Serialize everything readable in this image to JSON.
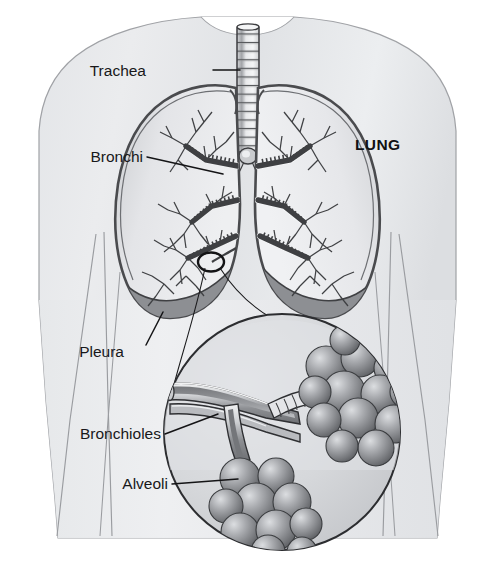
{
  "figure": {
    "width": 495,
    "height": 568,
    "background_color": "#ffffff"
  },
  "labels": {
    "trachea": "Trachea",
    "bronchi": "Bronchi",
    "lung": "LUNG",
    "pleura": "Pleura",
    "bronchioles": "Bronchioles",
    "alveoli": "Alveoli"
  },
  "colors": {
    "body_fill_light": "#e9eaec",
    "body_fill_mid": "#dcdee1",
    "body_outline": "#9b9da1",
    "lung_fill": "#e3e4e7",
    "lung_outline": "#4a4b4e",
    "pleura_fill": "#8d8f93",
    "trachea_fill": "#d2d4d7",
    "trachea_outline": "#3c3d40",
    "bronchi_fill": "#f2f3f4",
    "bronchi_outline": "#3e3f42",
    "inset_fill": "#d8dadd",
    "inset_outline": "#2c2d30",
    "alveoli_light": "#d7d9dc",
    "alveoli_mid": "#9c9ea2",
    "alveoli_dark": "#5e6063",
    "label_text": "#18181a",
    "leader_line": "#141416"
  },
  "structures": [
    {
      "name": "trachea",
      "label": "Trachea",
      "description": "Ringed cartilage windpipe running vertically from the neck to the carina where it splits",
      "label_position": {
        "x": 146,
        "y": 76
      },
      "leader_from": {
        "x": 213,
        "y": 70
      },
      "leader_to": {
        "x": 240,
        "y": 70
      }
    },
    {
      "name": "bronchi",
      "label": "Bronchi",
      "description": "Branching airway tree inside each lung",
      "label_position": {
        "x": 84,
        "y": 162
      },
      "leader_from": {
        "x": 147,
        "y": 157
      },
      "leader_to": {
        "x": 223,
        "y": 174
      }
    },
    {
      "name": "lung",
      "label": "LUNG",
      "description": "Right lung of the patient, labelled on the image right side",
      "label_position": {
        "x": 355,
        "y": 150
      }
    },
    {
      "name": "pleura",
      "label": "Pleura",
      "description": "Dark membrane lining the base of each lung",
      "label_position": {
        "x": 124,
        "y": 357
      },
      "leader_from": {
        "x": 146,
        "y": 345
      },
      "leader_to": {
        "x": 163,
        "y": 312
      }
    },
    {
      "name": "bronchioles",
      "label": "Bronchioles",
      "description": "Small cut-away airway tubes shown in the magnified inset",
      "label_position": {
        "x": 78,
        "y": 439
      },
      "leader_from": {
        "x": 165,
        "y": 434
      },
      "leader_to": {
        "x": 218,
        "y": 414
      }
    },
    {
      "name": "alveoli",
      "label": "Alveoli",
      "description": "Clusters of spherical air sacs at the ends of the bronchioles",
      "label_position": {
        "x": 116,
        "y": 489
      },
      "leader_from": {
        "x": 172,
        "y": 484
      },
      "leader_to": {
        "x": 238,
        "y": 479
      }
    }
  ],
  "inset": {
    "description": "Circular magnification of the boxed region of the lower left lung showing bronchioles and alveoli",
    "center": {
      "x": 282,
      "y": 432
    },
    "radius": 118,
    "source_marker": {
      "x": 211,
      "y": 262,
      "rx": 13,
      "ry": 9
    }
  }
}
